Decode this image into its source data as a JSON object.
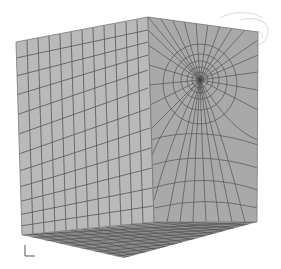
{
  "figure": {
    "colors": {
      "background": "#ffffff",
      "left_face": "#b9b9b9",
      "right_face": "#a9a9a9",
      "bottom_face": "#8a8a8a",
      "mesh_line": "#555555",
      "watermark": "#e0e0e0"
    },
    "vertices": {
      "top_left": [
        16,
        42
      ],
      "top_center": [
        148,
        17
      ],
      "top_right": [
        258,
        32
      ],
      "bottom_left": [
        22,
        235
      ],
      "bottom_center": [
        154,
        222
      ],
      "bottom_right": [
        257,
        222
      ],
      "front_bottom": [
        124,
        258
      ]
    },
    "refinement_point": [
      200,
      80
    ],
    "left_face_columns": 12,
    "right_face_columns": 16,
    "triad": {
      "label": "axis-triad"
    }
  }
}
